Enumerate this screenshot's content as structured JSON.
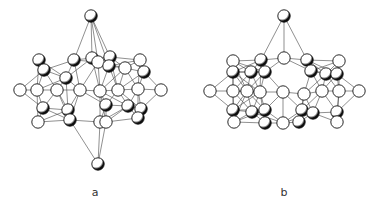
{
  "figure": {
    "panels": [
      {
        "label": "a",
        "label_pos": [
          95,
          196
        ],
        "atoms": [
          [
            91,
            16
          ],
          [
            39,
            60
          ],
          [
            74,
            60
          ],
          [
            92,
            58
          ],
          [
            110,
            57
          ],
          [
            140,
            60
          ],
          [
            44,
            70
          ],
          [
            98,
            62
          ],
          [
            109,
            66
          ],
          [
            125,
            68
          ],
          [
            144,
            72
          ],
          [
            20,
            90
          ],
          [
            37,
            90
          ],
          [
            57,
            90
          ],
          [
            80,
            90
          ],
          [
            100,
            91
          ],
          [
            118,
            90
          ],
          [
            138,
            89
          ],
          [
            161,
            90
          ],
          [
            66,
            78
          ],
          [
            43,
            108
          ],
          [
            68,
            110
          ],
          [
            70,
            120
          ],
          [
            106,
            105
          ],
          [
            128,
            106
          ],
          [
            141,
            109
          ],
          [
            38,
            122
          ],
          [
            100,
            122
          ],
          [
            106,
            122
          ],
          [
            138,
            118
          ],
          [
            98,
            164
          ]
        ],
        "shaded": [
          0,
          1,
          2,
          3,
          4,
          6,
          8,
          10,
          19,
          20,
          21,
          22,
          23,
          24,
          25,
          29,
          30
        ]
      },
      {
        "label": "b",
        "label_pos": [
          284,
          196
        ],
        "atoms": [
          [
            284,
            16
          ],
          [
            233,
            61
          ],
          [
            261,
            60
          ],
          [
            284,
            58
          ],
          [
            307,
            60
          ],
          [
            339,
            61
          ],
          [
            233,
            72
          ],
          [
            251,
            72
          ],
          [
            265,
            72
          ],
          [
            311,
            71
          ],
          [
            326,
            74
          ],
          [
            337,
            74
          ],
          [
            210,
            91
          ],
          [
            233,
            91
          ],
          [
            247,
            91
          ],
          [
            260,
            92
          ],
          [
            283,
            92
          ],
          [
            304,
            94
          ],
          [
            322,
            91
          ],
          [
            339,
            91
          ],
          [
            359,
            91
          ],
          [
            233,
            110
          ],
          [
            252,
            112
          ],
          [
            265,
            110
          ],
          [
            302,
            110
          ],
          [
            313,
            113
          ],
          [
            337,
            112
          ],
          [
            234,
            122
          ],
          [
            265,
            123
          ],
          [
            283,
            123
          ],
          [
            299,
            122
          ],
          [
            337,
            122
          ]
        ],
        "shaded": [
          0,
          2,
          4,
          6,
          7,
          8,
          9,
          10,
          11,
          21,
          22,
          23,
          24,
          25,
          26,
          28,
          30
        ]
      }
    ]
  }
}
